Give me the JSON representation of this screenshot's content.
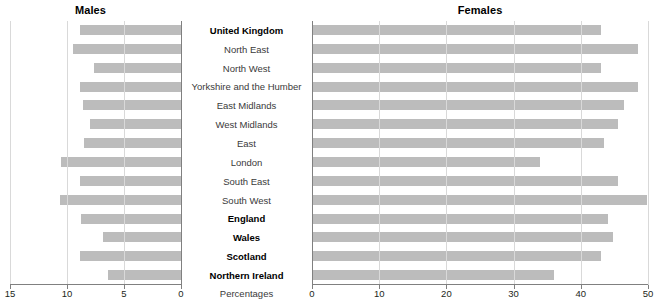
{
  "chart_data": {
    "type": "bar",
    "title": "",
    "orientation": "horizontal-pyramid",
    "xlabel": "Percentages",
    "ylabel": "",
    "grid": true,
    "legend": "none",
    "panels": [
      {
        "name": "males",
        "label": "Males",
        "axis": {
          "min": 0,
          "max": 15,
          "reversed": true,
          "ticks": [
            15,
            10,
            5,
            0
          ]
        }
      },
      {
        "name": "females",
        "label": "Females",
        "axis": {
          "min": 0,
          "max": 50,
          "reversed": false,
          "ticks": [
            0,
            10,
            20,
            30,
            40,
            50
          ]
        }
      }
    ],
    "categories": [
      "United Kingdom",
      "North East",
      "North West",
      "Yorkshire and the Humber",
      "East Midlands",
      "West Midlands",
      "East",
      "London",
      "South East",
      "South West",
      "England",
      "Wales",
      "Scotland",
      "Northern Ireland"
    ],
    "category_emphasis": [
      true,
      false,
      false,
      false,
      false,
      false,
      false,
      false,
      false,
      false,
      true,
      true,
      true,
      true
    ],
    "series": [
      {
        "name": "Males",
        "panel": "males",
        "values": [
          8.9,
          9.5,
          7.6,
          8.9,
          8.6,
          8.0,
          8.5,
          10.5,
          8.9,
          10.6,
          8.8,
          6.8,
          8.9,
          6.4
        ]
      },
      {
        "name": "Females",
        "panel": "females",
        "values": [
          43.0,
          48.5,
          43.0,
          48.5,
          46.5,
          45.5,
          43.5,
          34.0,
          45.5,
          49.8,
          44.0,
          44.8,
          43.0,
          36.0
        ]
      }
    ]
  },
  "colors": {
    "bar": "#bcbcbc",
    "gridline": "#d9d9d9",
    "axis": "#808080",
    "text": "#231f20"
  },
  "axis_caption": "Percentages"
}
